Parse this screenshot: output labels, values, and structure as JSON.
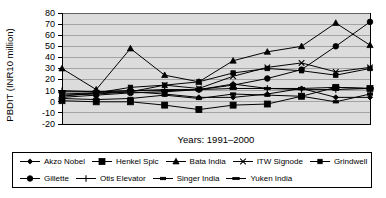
{
  "chart_data": {
    "type": "line",
    "title": "",
    "xlabel": "Years: 1991–2000",
    "ylabel": "PBDIT (INR10 million)",
    "x": [
      1991,
      1992,
      1993,
      1994,
      1995,
      1996,
      1997,
      1998,
      1999,
      2000
    ],
    "xtick_labels": [],
    "ytick_labels": [
      "80",
      "70",
      "60",
      "50",
      "40",
      "30",
      "20",
      "10",
      "0",
      "-10",
      "-20"
    ],
    "ylim": [
      -20,
      80
    ],
    "ytick_step": 10,
    "grid": true,
    "legend_position": "bottom",
    "plot_background": "#dcdcdc",
    "line_color": "#000000",
    "series": [
      {
        "name": "Akzo Nobel",
        "marker": "diamond",
        "values": [
          6,
          7,
          9,
          7,
          4,
          4,
          7,
          12,
          4,
          4
        ]
      },
      {
        "name": "Henkel Spic",
        "marker": "square-large",
        "values": [
          1,
          0,
          0,
          -3,
          -7,
          -3,
          -2,
          5,
          13,
          12
        ]
      },
      {
        "name": "Bata India",
        "marker": "triangle",
        "values": [
          30,
          11,
          48,
          24,
          18,
          37,
          45,
          50,
          71,
          51
        ]
      },
      {
        "name": "ITW Signode",
        "marker": "cross-x",
        "values": [
          5,
          8,
          9,
          15,
          12,
          23,
          31,
          35,
          27,
          31
        ]
      },
      {
        "name": "Grindwell",
        "marker": "square-small",
        "values": [
          7,
          8,
          13,
          15,
          18,
          26,
          30,
          28,
          24,
          30
        ]
      },
      {
        "name": "Gillette",
        "marker": "circle",
        "values": [
          4,
          6,
          8,
          9,
          11,
          15,
          21,
          29,
          50,
          72
        ]
      },
      {
        "name": "Otis Elevator",
        "marker": "plus",
        "values": [
          10,
          9,
          10,
          11,
          11,
          16,
          12,
          11,
          11,
          12
        ]
      },
      {
        "name": "Singer India",
        "marker": "bar",
        "values": [
          3,
          2,
          3,
          6,
          3,
          7,
          6,
          5,
          0,
          7
        ]
      },
      {
        "name": "Yuken India",
        "marker": "dash",
        "values": [
          9,
          9,
          10,
          10,
          11,
          12,
          12,
          12,
          13,
          12
        ]
      }
    ]
  },
  "legend": {
    "row1": [
      "Akzo Nobel",
      "Henkel Spic",
      "Bata India",
      "ITW Signode",
      "Grindwell"
    ],
    "row2": [
      "Gillette",
      "Otis Elevator",
      "Singer India",
      "Yuken India"
    ]
  }
}
